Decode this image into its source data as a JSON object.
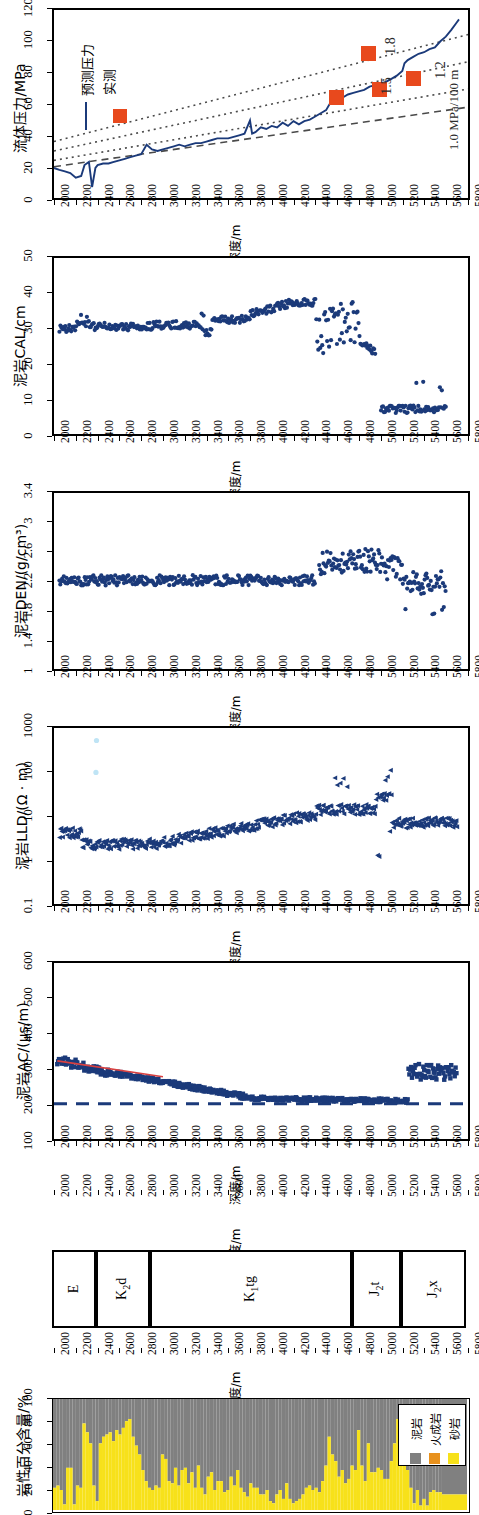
{
  "figure": {
    "orientation": "rotated-90",
    "depth_axis": {
      "label": "深度/m",
      "min": 2000,
      "max": 5800,
      "step": 200,
      "ticks": [
        2000,
        2200,
        2400,
        2600,
        2800,
        3000,
        3200,
        3400,
        3600,
        3800,
        4000,
        4200,
        4400,
        4600,
        4800,
        5000,
        5200,
        5400,
        5600,
        5800
      ]
    }
  },
  "panels": [
    {
      "id": "fluid-pressure",
      "ylabel": "流体压力/MPa",
      "yticks": [
        0,
        20,
        40,
        60,
        80,
        100,
        120
      ],
      "legend": [
        {
          "label": "预测压力",
          "type": "line",
          "color": "#1b3a7a"
        },
        {
          "label": "实测",
          "type": "square",
          "color": "#e8491d"
        }
      ],
      "gradient_labels": [
        "1.8",
        "1.5",
        "1.2",
        "1.0 MPa/100 m"
      ]
    },
    {
      "id": "mudstone-cal",
      "ylabel": "泥岩CAL/cm",
      "yticks": [
        0,
        10,
        20,
        30,
        40,
        50
      ]
    },
    {
      "id": "mudstone-den",
      "ylabel": "泥岩DEN/(g/cm³)",
      "yticks": [
        "1",
        "1.4",
        "1.8",
        "2.2",
        "2.6",
        "3",
        "3.4"
      ]
    },
    {
      "id": "mudstone-lld",
      "ylabel": "泥岩LLD/(Ω · m)",
      "yticks": [
        "0.1",
        "1",
        "10",
        "100",
        "1000"
      ]
    },
    {
      "id": "mudstone-ac",
      "ylabel": "泥岩AC/(μs/m)",
      "yticks": [
        100,
        200,
        300,
        400,
        500,
        600
      ]
    },
    {
      "id": "stratigraphy",
      "units": [
        {
          "name": "E",
          "sub": "",
          "suffix": "",
          "start": 2000,
          "end": 2400
        },
        {
          "name": "K",
          "sub": "2",
          "suffix": "d",
          "start": 2400,
          "end": 2900
        },
        {
          "name": "K",
          "sub": "1",
          "suffix": "tg",
          "start": 2900,
          "end": 4750
        },
        {
          "name": "J",
          "sub": "2",
          "suffix": "t",
          "start": 4750,
          "end": 5200
        },
        {
          "name": "J",
          "sub": "2",
          "suffix": "x",
          "start": 5200,
          "end": 5800
        }
      ]
    },
    {
      "id": "lithology-percent",
      "ylabel": "岩性百分含量/%",
      "yticks": [
        0,
        20,
        40,
        60,
        80,
        100
      ],
      "legend": [
        {
          "label": "砂岩",
          "color": "#f7e11a"
        },
        {
          "label": "火成岩",
          "color": "#e8911d"
        },
        {
          "label": "泥岩",
          "color": "#808080"
        }
      ]
    }
  ],
  "chart_data": [
    {
      "type": "line",
      "id": "fluid-pressure",
      "title": "",
      "xlabel": "深度/m",
      "ylabel": "流体压力/MPa",
      "xlim": [
        2000,
        5800
      ],
      "ylim": [
        0,
        120
      ],
      "grid": false,
      "legend_position": "top-left",
      "series": [
        {
          "name": "预测压力",
          "color": "#1b3a7a",
          "x": [
            2000,
            2050,
            2100,
            2150,
            2200,
            2250,
            2280,
            2320,
            2350,
            2380,
            2400,
            2450,
            2500,
            2550,
            2600,
            2650,
            2700,
            2750,
            2800,
            2850,
            2900,
            2950,
            3000,
            3050,
            3100,
            3150,
            3200,
            3250,
            3300,
            3350,
            3400,
            3450,
            3500,
            3550,
            3600,
            3650,
            3700,
            3750,
            3800,
            3820,
            3850,
            3900,
            3950,
            4000,
            4050,
            4100,
            4150,
            4200,
            4250,
            4300,
            4350,
            4400,
            4450,
            4500,
            4550,
            4600,
            4650,
            4700,
            4750,
            4800,
            4850,
            4900,
            4950,
            5000,
            5050,
            5100,
            5150,
            5200,
            5220,
            5250,
            5300,
            5350,
            5400,
            5450,
            5500,
            5550,
            5600,
            5650,
            5700
          ],
          "y": [
            19,
            18,
            17,
            16,
            13,
            14,
            21,
            23,
            7,
            19,
            21,
            22,
            22,
            23,
            24,
            25,
            26,
            27,
            28,
            34,
            31,
            30,
            31,
            32,
            33,
            34,
            33,
            34,
            35,
            35,
            36,
            37,
            38,
            38,
            38,
            39,
            40,
            41,
            50,
            41,
            42,
            45,
            44,
            46,
            45,
            48,
            46,
            49,
            47,
            49,
            48,
            50,
            52,
            54,
            56,
            62,
            66,
            64,
            66,
            67,
            68,
            69,
            71,
            72,
            73,
            74,
            76,
            78,
            86,
            88,
            90,
            92,
            93,
            95,
            96,
            100,
            103,
            107,
            112
          ]
        },
        {
          "name": "实测",
          "color": "#e8491d",
          "type": "scatter",
          "x": [
            2470,
            4580,
            4880,
            4970,
            5280
          ],
          "y": [
            59,
            65,
            93,
            70,
            77
          ],
          "note": "first point at 2470/59 is the legend marker"
        },
        {
          "name": "1.0 MPa/100 m",
          "type": "gradient",
          "gradient": 1.0,
          "style": "dashed",
          "color": "#4a4a4a"
        },
        {
          "name": "1.2",
          "type": "gradient",
          "gradient": 1.2,
          "style": "dotted",
          "color": "#4a4a4a"
        },
        {
          "name": "1.5",
          "type": "gradient",
          "gradient": 1.5,
          "style": "dotted",
          "color": "#4a4a4a"
        },
        {
          "name": "1.8",
          "type": "gradient",
          "gradient": 1.8,
          "style": "dotted",
          "color": "#4a4a4a"
        }
      ]
    },
    {
      "type": "scatter",
      "id": "mudstone-cal",
      "xlabel": "深度/m",
      "ylabel": "泥岩CAL/cm",
      "xlim": [
        2000,
        5800
      ],
      "ylim": [
        0,
        50
      ],
      "grid": false,
      "color": "#1b3a7a",
      "description": "Caliper ~30 cm from 2000-3400 m, rising to 36-41 cm at 4000-4400 m, scattered 20-36 cm 4400-4900 m, dropping to 5-10 cm below 5000 m, ending ~5600 m"
    },
    {
      "type": "scatter",
      "id": "mudstone-den",
      "xlabel": "深度/m",
      "ylabel": "泥岩DEN/(g/cm³)",
      "xlim": [
        2000,
        5800
      ],
      "ylim": [
        1,
        3.4
      ],
      "grid": false,
      "color": "#1b3a7a",
      "description": "Density clustered 2.1-2.3 g/cm3 from 2000-4400 m, jumping to 2.4-2.65 g/cm3 from 4450-5100 m, then scattering 1.8-2.6 below 5200 m"
    },
    {
      "type": "scatter",
      "id": "mudstone-lld",
      "xlabel": "深度/m",
      "ylabel": "泥岩LLD/(Ω · m)",
      "xlim": [
        2000,
        5800
      ],
      "ylim": [
        0.1,
        1000
      ],
      "yscale": "log",
      "grid": false,
      "color": "#1b3a7a",
      "description": "Resistivity ~4 ohm.m at 2000 m, dipping to ~2 at 2400-3000 m, rising steadily to ~12 at 4400 m, spikes to 50-100 at 4600 and 5050 m, scatters 1-60 below 5000 m"
    },
    {
      "type": "scatter",
      "id": "mudstone-ac",
      "xlabel": "深度/m",
      "ylabel": "泥岩AC/(μs/m)",
      "xlim": [
        2000,
        5800
      ],
      "ylim": [
        100,
        600
      ],
      "grid": false,
      "color": "#1b3a7a",
      "trend_color": "#d94040",
      "reference_line": {
        "value": 200,
        "style": "dashed",
        "color": "#1b3a7a"
      },
      "description": "Sonic transit time ~320 us/m at 2000 m decreasing to ~200 us/m at 3800-5200 m, then increasing to 250-400 us/m below 5300 m"
    },
    {
      "type": "table",
      "id": "stratigraphy",
      "xlabel": "深度/m",
      "columns": [
        "formation",
        "top",
        "base"
      ],
      "rows": [
        [
          "E",
          2000,
          2400
        ],
        [
          "K2d",
          2400,
          2900
        ],
        [
          "K1tg",
          2900,
          4750
        ],
        [
          "J2t",
          4750,
          5200
        ],
        [
          "J2x",
          5200,
          5800
        ]
      ]
    },
    {
      "type": "area",
      "id": "lithology-percent",
      "xlabel": "深度/m",
      "ylabel": "岩性百分含量/%",
      "xlim": [
        2000,
        5800
      ],
      "ylim": [
        0,
        100
      ],
      "grid": false,
      "stacked": true,
      "series": [
        {
          "name": "砂岩",
          "color": "#f7e11a"
        },
        {
          "name": "火成岩",
          "color": "#e8911d"
        },
        {
          "name": "泥岩",
          "color": "#808080"
        }
      ],
      "x": [
        2000,
        2030,
        2060,
        2090,
        2120,
        2150,
        2180,
        2210,
        2240,
        2270,
        2300,
        2330,
        2360,
        2390,
        2420,
        2450,
        2480,
        2510,
        2540,
        2570,
        2600,
        2630,
        2660,
        2690,
        2720,
        2750,
        2780,
        2810,
        2840,
        2870,
        2900,
        2930,
        2960,
        2990,
        3020,
        3050,
        3080,
        3110,
        3140,
        3170,
        3200,
        3230,
        3260,
        3290,
        3320,
        3350,
        3380,
        3410,
        3440,
        3470,
        3500,
        3530,
        3560,
        3590,
        3620,
        3650,
        3680,
        3710,
        3740,
        3770,
        3800,
        3830,
        3860,
        3890,
        3920,
        3950,
        3980,
        4010,
        4040,
        4070,
        4100,
        4130,
        4160,
        4190,
        4220,
        4250,
        4280,
        4310,
        4340,
        4370,
        4400,
        4430,
        4460,
        4490,
        4520,
        4550,
        4580,
        4610,
        4640,
        4670,
        4700,
        4730,
        4760,
        4790,
        4820,
        4850,
        4880,
        4910,
        4940,
        4970,
        5000,
        5030,
        5060,
        5090,
        5120,
        5150,
        5180,
        5210,
        5240,
        5270,
        5300,
        5330,
        5360,
        5390,
        5420,
        5450,
        5480,
        5510,
        5540,
        5570,
        5800
      ],
      "sandstone_pct": [
        20,
        22,
        18,
        5,
        38,
        38,
        5,
        22,
        20,
        78,
        70,
        60,
        22,
        8,
        60,
        66,
        68,
        70,
        62,
        72,
        68,
        74,
        80,
        82,
        66,
        58,
        50,
        36,
        26,
        20,
        18,
        22,
        20,
        50,
        46,
        26,
        24,
        38,
        22,
        36,
        38,
        24,
        34,
        20,
        40,
        20,
        14,
        30,
        34,
        18,
        26,
        26,
        16,
        18,
        30,
        22,
        36,
        20,
        16,
        12,
        24,
        20,
        20,
        14,
        14,
        18,
        8,
        6,
        14,
        18,
        10,
        24,
        10,
        6,
        8,
        10,
        14,
        20,
        22,
        18,
        20,
        16,
        26,
        40,
        66,
        50,
        44,
        30,
        36,
        24,
        28,
        40,
        36,
        72,
        40,
        26,
        60,
        34,
        34,
        38,
        36,
        28,
        28,
        44,
        60,
        82,
        50,
        40,
        36,
        20,
        6,
        18,
        4,
        10,
        4,
        16,
        18,
        16,
        16,
        14,
        12,
        16,
        14,
        12,
        14
      ]
    }
  ]
}
